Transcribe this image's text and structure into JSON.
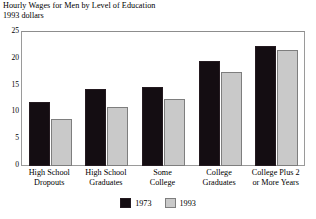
{
  "chart_data": {
    "type": "bar",
    "title": "Hourly Wages for Men by Level of Education",
    "subtitle": "1993 dollars",
    "xlabel": "",
    "ylabel": "",
    "ylim": [
      0,
      25
    ],
    "y_major_ticks": [
      0,
      5,
      10,
      15,
      20,
      25
    ],
    "y_minor_tick_step": 1,
    "y_tick_labels": [
      "0",
      "5",
      "10",
      "15",
      "20",
      "25"
    ],
    "grid": false,
    "legend_position": "bottom-center",
    "categories": [
      "High School\nDropouts",
      "High School\nGraduates",
      "Some\nCollege",
      "College\nGraduates",
      "College Plus 2\nor More Years"
    ],
    "series": [
      {
        "name": "1973",
        "color": "#140d12",
        "values": [
          12.0,
          14.3,
          14.8,
          19.5,
          22.3
        ]
      },
      {
        "name": "1993",
        "color": "#c9c9c9",
        "values": [
          8.7,
          11.1,
          12.5,
          17.6,
          21.7
        ]
      }
    ]
  }
}
